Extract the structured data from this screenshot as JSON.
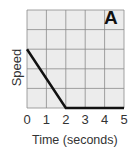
{
  "chart_data": {
    "type": "line",
    "title": "A",
    "xlabel": "Time (seconds)",
    "ylabel": "Speed",
    "x_ticks": [
      "0",
      "1",
      "2",
      "3",
      "4",
      "5"
    ],
    "xlim": [
      0,
      5
    ],
    "ylim": [
      0,
      5
    ],
    "grid": true,
    "series": [
      {
        "name": "Speed",
        "x": [
          0,
          2,
          5
        ],
        "y": [
          3,
          0,
          0
        ]
      }
    ]
  },
  "colors": {
    "grid": "#8a8a8a",
    "background": "#ececec",
    "line": "#111111"
  }
}
